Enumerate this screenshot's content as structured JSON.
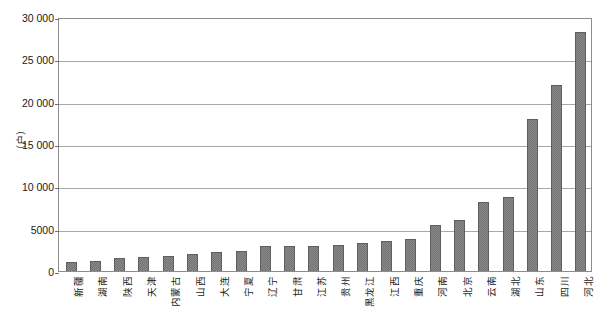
{
  "chart_data": {
    "type": "bar",
    "title": "",
    "subtitle": "",
    "xlabel": "",
    "ylabel": "（户）",
    "ylim": [
      0,
      30000
    ],
    "grid": true,
    "legend": null,
    "y_ticks": [
      "0",
      "5000",
      "10 000",
      "15 000",
      "20 000",
      "25 000",
      "30 000"
    ],
    "y_tick_values": [
      0,
      5000,
      10000,
      15000,
      20000,
      25000,
      30000
    ],
    "categories": [
      "新疆",
      "湖南",
      "陕西",
      "天津",
      "内蒙古",
      "山西",
      "大连",
      "宁夏",
      "辽宁",
      "甘肃",
      "江苏",
      "贵州",
      "黑龙江",
      "江西",
      "重庆",
      "河南",
      "北京",
      "云南",
      "湖北",
      "山东",
      "四川",
      "河北"
    ],
    "values": [
      1100,
      1200,
      1500,
      1700,
      1800,
      2000,
      2200,
      2400,
      2900,
      2950,
      3000,
      3050,
      3300,
      3500,
      3800,
      5400,
      6000,
      8200,
      8700,
      18000,
      22000,
      28200
    ],
    "bar_color": "#737373",
    "frame_color": "#8c8c8c",
    "gridline_color": "#a8a8a8"
  }
}
